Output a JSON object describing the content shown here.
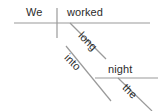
{
  "diagram": {
    "type": "reed-kellogg-sentence-diagram",
    "sentence": "We worked long into the night",
    "background_color": "#ffffff",
    "line_color": "#9a9a9a",
    "text_color": "#2b2b2b",
    "words": {
      "subject": "We",
      "verb": "worked",
      "adverb": "long",
      "preposition": "into",
      "object_of_preposition": "night",
      "article": "the"
    },
    "lines": [
      {
        "name": "main-baseline",
        "role": "subject-verb baseline",
        "x1": 14,
        "y1": 23,
        "x2": 150,
        "y2": 23
      },
      {
        "name": "subject-verb-divider",
        "role": "vertical bar separating subject and verb",
        "x1": 57,
        "y1": 8,
        "x2": 57,
        "y2": 38
      },
      {
        "name": "adverb-long-slant",
        "role": "slanted line for adverb 'long'",
        "x1": 70,
        "y1": 23,
        "x2": 106,
        "y2": 59
      },
      {
        "name": "preposition-into-slant",
        "role": "slanted line for preposition 'into'",
        "x1": 66,
        "y1": 46,
        "x2": 111,
        "y2": 101
      },
      {
        "name": "object-night-baseline",
        "role": "horizontal line for object of preposition 'night'",
        "x1": 95,
        "y1": 78,
        "x2": 158,
        "y2": 78
      },
      {
        "name": "article-the-slant",
        "role": "slanted line for article 'the'",
        "x1": 118,
        "y1": 78,
        "x2": 152,
        "y2": 111
      }
    ]
  }
}
